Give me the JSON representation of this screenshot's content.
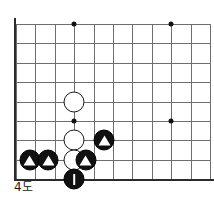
{
  "figure": {
    "caption": "4도",
    "kind": "go-board-diagram"
  },
  "board": {
    "columns": 11,
    "rows": 9,
    "cell_size": 19.4,
    "origin_x": 16,
    "origin_y": 24,
    "line_color": "#6f6f6f",
    "edge_color": "#2b2b2b",
    "background": "#ffffff",
    "edges": [
      "left",
      "bottom"
    ],
    "star_points": [
      {
        "col": 3,
        "row": 0
      },
      {
        "col": 8,
        "row": 0
      },
      {
        "col": 3,
        "row": 5
      },
      {
        "col": 8,
        "row": 5
      }
    ],
    "stones": [
      {
        "col": 3,
        "row": 4,
        "color": "white",
        "marker": "none",
        "label": ""
      },
      {
        "col": 3,
        "row": 6,
        "color": "white",
        "marker": "none",
        "label": ""
      },
      {
        "col": 3,
        "row": 7,
        "color": "white",
        "marker": "none",
        "label": ""
      },
      {
        "col": 0.7,
        "row": 7,
        "color": "black",
        "marker": "triangle",
        "label": ""
      },
      {
        "col": 1.65,
        "row": 7,
        "color": "black",
        "marker": "triangle",
        "label": ""
      },
      {
        "col": 3.6,
        "row": 7,
        "color": "black",
        "marker": "triangle",
        "label": ""
      },
      {
        "col": 4.55,
        "row": 6,
        "color": "black",
        "marker": "triangle",
        "label": ""
      },
      {
        "col": 3,
        "row": 8,
        "color": "black",
        "marker": "one",
        "label": "1"
      }
    ]
  }
}
